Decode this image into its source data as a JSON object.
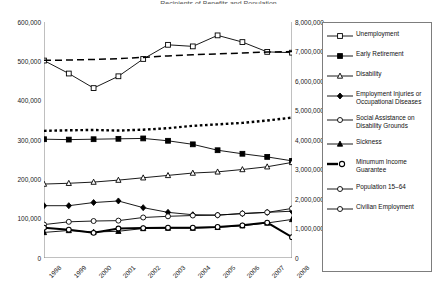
{
  "title_sliver": "Recipients of Benefits and Population",
  "axes": {
    "left": {
      "ticks": [
        "600,000",
        "500,000",
        "400,000",
        "300,000",
        "200,000",
        "100,000",
        "0"
      ],
      "min": 0,
      "max": 600000,
      "step": 100000
    },
    "right": {
      "ticks": [
        "8,000,000",
        "7,000,000",
        "6,000,000",
        "5,000,000",
        "4,000,000",
        "3,000,000",
        "2,000,000",
        "1,000,000",
        "0"
      ],
      "min": 0,
      "max": 8000000,
      "step": 1000000
    },
    "x": {
      "ticks": [
        "1998",
        "1999",
        "2000",
        "2001",
        "2002",
        "2003",
        "2004",
        "2005",
        "2006",
        "2007",
        "2008"
      ]
    }
  },
  "legend": {
    "items": [
      {
        "label": "Unemployment",
        "key": "line-open-square",
        "axis": "left"
      },
      {
        "label": "Early Retirement",
        "key": "line-filled-square",
        "axis": "left"
      },
      {
        "label": "Disability",
        "key": "line-open-triangle",
        "axis": "left"
      },
      {
        "label": "Employment Injuries or\nOccupational Diseases",
        "key": "line-filled-diamond",
        "axis": "left"
      },
      {
        "label": "Social Assistance on\nDisability Grounds",
        "key": "line-open-circle",
        "axis": "left"
      },
      {
        "label": "Sickness",
        "key": "line-filled-triangle",
        "axis": "left"
      },
      {
        "label": "Minumum Income\nGuarantee",
        "key": "thick-open-circle",
        "axis": "left"
      },
      {
        "label": "Population 15–64",
        "key": "dashed-line",
        "axis": "right"
      },
      {
        "label": "Civilian Employment",
        "key": "dotted-line",
        "axis": "right"
      }
    ]
  },
  "chart_data": {
    "type": "line",
    "title": "Recipients of Benefits and Population",
    "xlabel": "",
    "ylabel": "",
    "x": [
      "1998",
      "1999",
      "2000",
      "2001",
      "2002",
      "2003",
      "2004",
      "2005",
      "2006",
      "2007",
      "2008"
    ],
    "ylim": [
      0,
      600000
    ],
    "y2lim": [
      0,
      8000000
    ],
    "ylabel_left": "Number of Benefit Recipients",
    "ylabel_right": "Population / Employment",
    "grid": false,
    "legend_position": "right-outside",
    "series": [
      {
        "name": "Unemployment",
        "axis": "left",
        "marker": "open-square",
        "linestyle": "solid",
        "values": [
          502000,
          469000,
          432000,
          462000,
          506000,
          542000,
          538000,
          566000,
          549000,
          524000,
          522000
        ]
      },
      {
        "name": "Early Retirement",
        "axis": "left",
        "marker": "filled-square",
        "linestyle": "solid",
        "values": [
          302000,
          301000,
          302000,
          303000,
          304000,
          298000,
          289000,
          274000,
          265000,
          257000,
          247000
        ]
      },
      {
        "name": "Disability",
        "axis": "left",
        "marker": "open-triangle",
        "linestyle": "solid",
        "values": [
          188000,
          190000,
          193000,
          198000,
          204000,
          210000,
          216000,
          219000,
          225000,
          232000,
          243000
        ]
      },
      {
        "name": "Employment Injuries or Occupational Diseases",
        "axis": "left",
        "marker": "filled-diamond",
        "linestyle": "solid",
        "values": [
          133000,
          133000,
          141000,
          145000,
          128000,
          116000,
          110000,
          109000,
          113000,
          116000,
          119000
        ]
      },
      {
        "name": "Social Assistance on Disability Grounds",
        "axis": "left",
        "marker": "open-circle",
        "linestyle": "solid",
        "values": [
          85000,
          92000,
          94000,
          95000,
          103000,
          106000,
          108000,
          109000,
          113000,
          116000,
          126000
        ]
      },
      {
        "name": "Sickness",
        "axis": "left",
        "marker": "filled-triangle",
        "linestyle": "solid",
        "values": [
          65000,
          70000,
          66000,
          68000,
          75000,
          76000,
          76000,
          78000,
          82000,
          89000,
          98000
        ]
      },
      {
        "name": "Minumum Income Guarantee",
        "axis": "left",
        "marker": "open-circle-thick",
        "linestyle": "thick",
        "values": [
          77000,
          72000,
          64000,
          75000,
          76000,
          77000,
          77000,
          79000,
          83000,
          90000,
          53000
        ]
      },
      {
        "name": "Population 15–64",
        "axis": "right",
        "marker": "none",
        "linestyle": "dashed",
        "values": [
          6700000,
          6710000,
          6730000,
          6760000,
          6800000,
          6850000,
          6890000,
          6920000,
          6950000,
          6980000,
          7000000
        ]
      },
      {
        "name": "Civilian Employment",
        "axis": "right",
        "marker": "none",
        "linestyle": "dotted",
        "values": [
          4310000,
          4330000,
          4340000,
          4320000,
          4350000,
          4400000,
          4480000,
          4530000,
          4580000,
          4660000,
          4760000
        ]
      }
    ]
  }
}
